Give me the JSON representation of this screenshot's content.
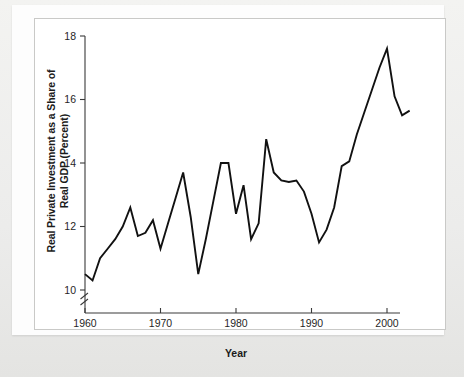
{
  "chart_data": {
    "type": "line",
    "title": "",
    "xlabel": "Year",
    "ylabel": "Real Private Investment as a Share of Real GDP (Percent)",
    "ylabel_line1": "Real Private Investment as a Share of",
    "ylabel_line2": "Real GDP (Percent)",
    "xlim": [
      1960,
      2003
    ],
    "ylim": [
      10,
      18
    ],
    "yticks": [
      10,
      12,
      14,
      16,
      18
    ],
    "ytick_labels": [
      "10",
      "12",
      "14",
      "16",
      "18"
    ],
    "xticks": [
      1960,
      1970,
      1980,
      1990,
      2000
    ],
    "xtick_labels": [
      "1960",
      "1970",
      "1980",
      "1990",
      "2000"
    ],
    "axis_break": true,
    "axis_break_note": "zigzag break on y-axis below 10",
    "grid": false,
    "legend": false,
    "line_color": "#111111",
    "x": [
      1960,
      1961,
      1962,
      1963,
      1964,
      1965,
      1966,
      1967,
      1968,
      1969,
      1970,
      1971,
      1972,
      1973,
      1974,
      1975,
      1976,
      1977,
      1978,
      1979,
      1980,
      1981,
      1982,
      1983,
      1984,
      1985,
      1986,
      1987,
      1988,
      1989,
      1990,
      1991,
      1992,
      1993,
      1994,
      1995,
      1996,
      1997,
      1998,
      1999,
      2000,
      2001,
      2002,
      2003
    ],
    "values": [
      10.5,
      10.3,
      11.0,
      11.3,
      11.6,
      12.0,
      12.6,
      11.7,
      11.8,
      12.2,
      11.3,
      12.1,
      12.9,
      13.7,
      12.3,
      10.5,
      11.6,
      12.8,
      14.0,
      14.0,
      12.4,
      13.3,
      11.6,
      12.1,
      14.75,
      13.7,
      13.45,
      13.4,
      13.45,
      13.1,
      12.4,
      11.5,
      11.9,
      12.6,
      13.9,
      14.05,
      14.9,
      15.6,
      16.3,
      17.0,
      17.6,
      16.1,
      15.5,
      15.65
    ],
    "series_name": "Real private investment share of real GDP"
  }
}
